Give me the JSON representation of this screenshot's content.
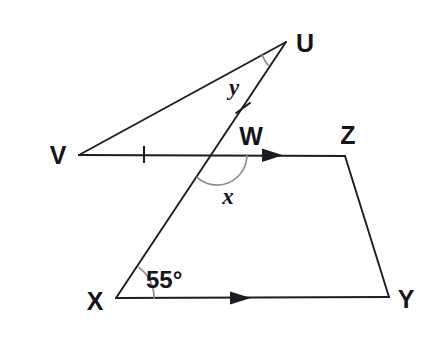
{
  "figure": {
    "background_color": "#ffffff",
    "line_color": "#1c1c22",
    "arc_color": "#8d8d93"
  },
  "vertices": {
    "U": {
      "label": "U",
      "x": 286,
      "y": 42,
      "label_x": 298,
      "label_y": 44
    },
    "V": {
      "label": "V",
      "x": 79,
      "y": 155,
      "label_x": 48,
      "label_y": 158
    },
    "W": {
      "label": "W",
      "x": 217,
      "y": 155,
      "label_x": 238,
      "label_y": 145
    },
    "X": {
      "label": "X",
      "x": 116,
      "y": 298,
      "label_x": 84,
      "label_y": 310
    },
    "Y": {
      "label": "Y",
      "x": 389,
      "y": 297,
      "label_x": 397,
      "label_y": 309
    },
    "Z": {
      "label": "Z",
      "x": 345,
      "y": 156,
      "label_x": 337,
      "label_y": 146
    }
  },
  "segments": [
    {
      "name": "segment-V-U",
      "from": "V",
      "to": "U"
    },
    {
      "name": "segment-V-Z",
      "from": "V",
      "to": "Z"
    },
    {
      "name": "segment-X-U",
      "from": "X",
      "to": "U"
    },
    {
      "name": "segment-X-Y",
      "from": "X",
      "to": "Y"
    },
    {
      "name": "segment-Z-Y",
      "from": "Z",
      "to": "Y"
    }
  ],
  "angle_labels": {
    "y": {
      "text": "y",
      "at_vertex": "U",
      "x": 234,
      "y": 95
    },
    "x": {
      "text": "x",
      "at_vertex": "W",
      "x": 225,
      "y": 205
    },
    "angle_55": {
      "text": "55°",
      "at_vertex": "X",
      "x": 146,
      "y": 288
    }
  },
  "tick_marks": [
    {
      "name": "congruence-tick-VW",
      "on_segment": "V-W",
      "x": 144,
      "y": 154
    },
    {
      "name": "congruence-tick-WU",
      "on_segment": "W-U",
      "x": 243,
      "y": 108
    }
  ],
  "direction_arrows": [
    {
      "name": "parallel-arrow-VZ",
      "on_segment": "V-Z",
      "x": 278,
      "y": 155
    },
    {
      "name": "parallel-arrow-XY",
      "on_segment": "X-Y",
      "x": 246,
      "y": 298
    }
  ],
  "angle_arcs": [
    {
      "name": "angle-arc-U",
      "at_vertex": "U",
      "radius": 27
    },
    {
      "name": "angle-arc-W",
      "at_vertex": "W",
      "radius": 30
    },
    {
      "name": "angle-arc-X",
      "at_vertex": "X",
      "radius": 38
    }
  ]
}
